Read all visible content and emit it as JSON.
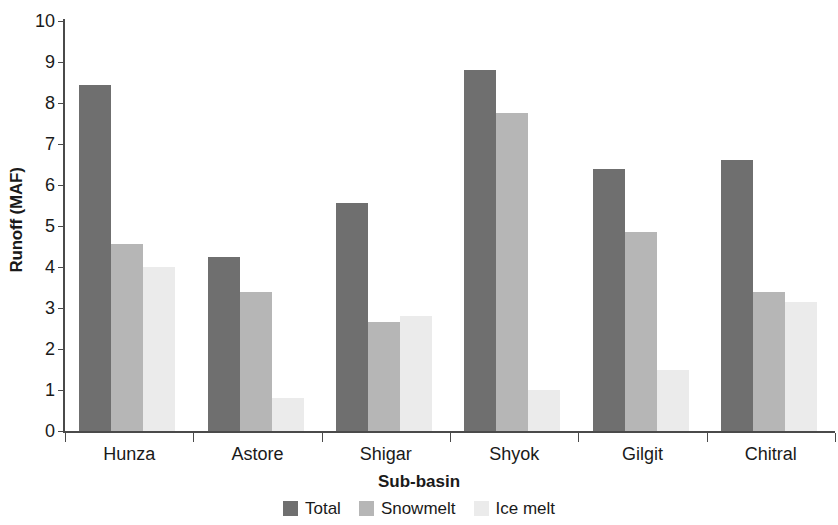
{
  "chart_data": {
    "type": "bar",
    "title": "",
    "xlabel": "Sub-basin",
    "ylabel": "Runoff (MAF)",
    "categories": [
      "Hunza",
      "Astore",
      "Shigar",
      "Shyok",
      "Gilgit",
      "Chitral"
    ],
    "series": [
      {
        "name": "Total",
        "color": "#6f6f6f",
        "values": [
          8.45,
          4.25,
          5.55,
          8.8,
          6.4,
          6.6
        ]
      },
      {
        "name": "Snowmelt",
        "color": "#b6b6b6",
        "values": [
          4.55,
          3.4,
          2.65,
          7.75,
          4.85,
          3.4
        ]
      },
      {
        "name": "Ice melt",
        "color": "#ebebeb",
        "values": [
          4.0,
          0.8,
          2.8,
          1.0,
          1.5,
          3.15
        ]
      }
    ],
    "ylim": [
      0,
      10
    ],
    "ytick_labels": [
      "0",
      "1",
      "2",
      "3",
      "4",
      "5",
      "6",
      "7",
      "8",
      "9",
      "10"
    ],
    "ytick_values": [
      0,
      1,
      2,
      3,
      4,
      5,
      6,
      7,
      8,
      9,
      10
    ],
    "grid": false,
    "legend_position": "bottom"
  },
  "legend": {
    "items": [
      {
        "label": "Total",
        "color": "#6f6f6f"
      },
      {
        "label": "Snowmelt",
        "color": "#b6b6b6"
      },
      {
        "label": "Ice melt",
        "color": "#ebebeb"
      }
    ]
  }
}
